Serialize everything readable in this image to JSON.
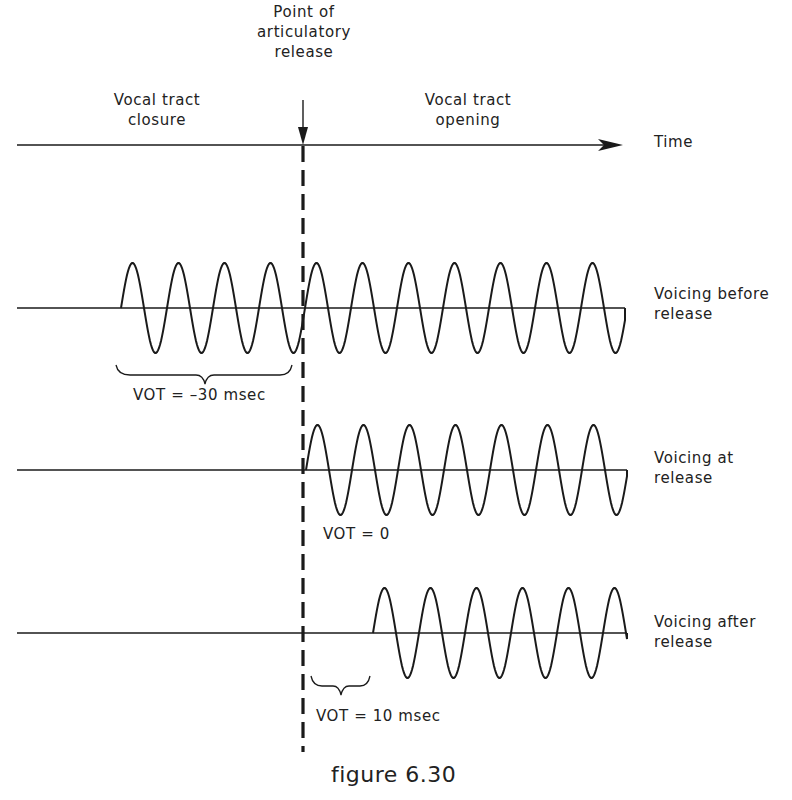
{
  "figure": {
    "caption": "figure 6.30",
    "top_labels": {
      "release_point": [
        "Point of",
        "articulatory",
        "release"
      ],
      "closure": [
        "Vocal tract",
        "closure"
      ],
      "opening": [
        "Vocal tract",
        "opening"
      ],
      "time_axis": "Time"
    },
    "rows": [
      {
        "label": [
          "Voicing before",
          "release"
        ],
        "vot_label": "VOT = –30 msec",
        "baseline_y": 308,
        "wave_start_x": 121,
        "wave_end_x": 625
      },
      {
        "label": [
          "Voicing at",
          "release"
        ],
        "vot_label": "VOT = 0",
        "baseline_y": 470,
        "wave_start_x": 306,
        "wave_end_x": 627
      },
      {
        "label": [
          "Voicing after",
          "release"
        ],
        "vot_label": "VOT = 10 msec",
        "baseline_y": 633,
        "wave_start_x": 373,
        "wave_end_x": 627
      }
    ],
    "geometry": {
      "time_axis_y": 145,
      "axis_start_x": 17,
      "axis_end_x": 623,
      "release_x": 303,
      "period_px": 46,
      "amplitude_px": 45
    },
    "colors": {
      "ink": "#1a1a1a",
      "background": "#ffffff"
    }
  }
}
